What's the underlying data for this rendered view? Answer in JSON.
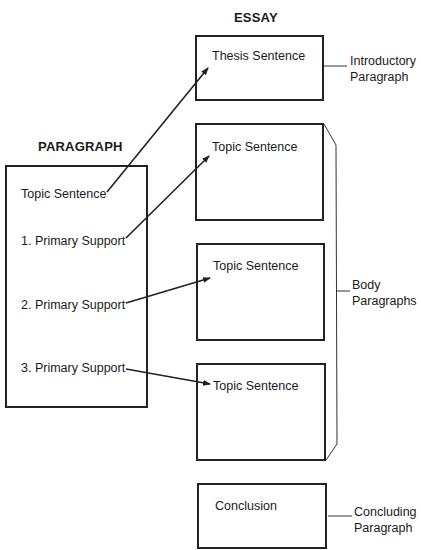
{
  "essay": {
    "heading": "ESSAY",
    "boxes": [
      {
        "text": "Thesis Sentence"
      },
      {
        "text": "Topic Sentence"
      },
      {
        "text": "Topic Sentence"
      },
      {
        "text": "Topic Sentence"
      },
      {
        "text": "Conclusion"
      }
    ],
    "side_labels": {
      "introductory": {
        "line1": "Introductory",
        "line2": "Paragraph"
      },
      "body": {
        "line1": "Body",
        "line2": "Paragraphs"
      },
      "concluding": {
        "line1": "Concluding",
        "line2": "Paragraph"
      }
    }
  },
  "paragraph": {
    "heading": "PARAGRAPH",
    "items": [
      {
        "text": "Topic Sentence"
      },
      {
        "text": "1. Primary Support"
      },
      {
        "text": "2. Primary Support"
      },
      {
        "text": "3. Primary Support"
      }
    ]
  },
  "colors": {
    "line": "#222222",
    "text": "#1a1a1a",
    "background": "#ffffff"
  }
}
